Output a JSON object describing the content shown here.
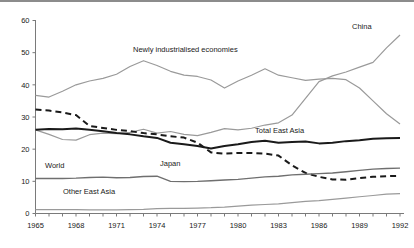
{
  "chart_data": {
    "type": "line",
    "title": "",
    "subtitle": "",
    "xlabel": "",
    "ylabel": "",
    "xlim": [
      1965,
      1992
    ],
    "ylim": [
      0,
      60
    ],
    "grid": false,
    "legend_position": "inline-annotations",
    "x": [
      1965,
      1966,
      1967,
      1968,
      1969,
      1970,
      1971,
      1972,
      1973,
      1974,
      1975,
      1976,
      1977,
      1978,
      1979,
      1980,
      1981,
      1982,
      1983,
      1984,
      1985,
      1986,
      1987,
      1988,
      1989,
      1990,
      1991,
      1992
    ],
    "xticks": [
      "1965",
      "1968",
      "1971",
      "1974",
      "1977",
      "1980",
      "1983",
      "1986",
      "1989",
      "1992"
    ],
    "yticks": [
      "0",
      "10",
      "20",
      "30",
      "40",
      "50",
      "60"
    ],
    "series": [
      {
        "name": "Newly industrialised economies",
        "color": "#9a9a9a",
        "style": "solid",
        "width": 1.2,
        "label_x": 133,
        "label_y": 52,
        "values": [
          36.7,
          36.2,
          38.0,
          40.0,
          41.2,
          42.0,
          43.3,
          45.7,
          47.5,
          46.0,
          44.2,
          43.0,
          42.6,
          41.5,
          39.0,
          41.2,
          43.0,
          45.0,
          43.0,
          42.2,
          41.4,
          41.8,
          42.0,
          41.6,
          39.0,
          35.0,
          31.0,
          27.8
        ]
      },
      {
        "name": "China",
        "color": "#9a9a9a",
        "style": "solid",
        "width": 1.2,
        "label_x": 352,
        "label_y": 29,
        "values": [
          26.0,
          24.6,
          23.0,
          22.8,
          24.5,
          25.0,
          24.8,
          25.2,
          26.2,
          25.0,
          25.5,
          24.6,
          24.2,
          25.2,
          26.4,
          26.0,
          26.5,
          27.5,
          28.2,
          30.6,
          35.8,
          41.0,
          42.8,
          44.0,
          45.5,
          47.0,
          51.5,
          55.5
        ]
      },
      {
        "name": "Total East Asia",
        "color": "#1a1a1a",
        "style": "solid",
        "width": 2.0,
        "label_x": 255,
        "label_y": 133,
        "values": [
          26.0,
          26.3,
          26.2,
          26.4,
          26.0,
          25.6,
          25.0,
          24.6,
          24.0,
          23.5,
          22.0,
          21.5,
          21.0,
          20.2,
          21.0,
          21.5,
          22.2,
          22.6,
          22.0,
          22.2,
          22.4,
          21.8,
          22.0,
          22.5,
          22.8,
          23.2,
          23.4,
          23.5
        ]
      },
      {
        "name": "Japan",
        "color": "#1a1a1a",
        "style": "dashed",
        "width": 2.0,
        "label_x": 160,
        "label_y": 166,
        "values": [
          32.3,
          32.0,
          31.4,
          30.6,
          27.2,
          26.6,
          26.0,
          25.6,
          25.0,
          24.6,
          24.0,
          23.6,
          22.0,
          19.0,
          18.6,
          18.8,
          18.8,
          18.6,
          18.0,
          15.0,
          12.6,
          11.4,
          10.6,
          10.5,
          11.0,
          11.4,
          11.6,
          11.7
        ]
      },
      {
        "name": "World",
        "color": "#6f6f6f",
        "style": "solid",
        "width": 1.4,
        "label_x": 45,
        "label_y": 168,
        "values": [
          10.9,
          10.9,
          10.9,
          11.0,
          11.2,
          11.3,
          11.1,
          11.2,
          11.5,
          11.6,
          10.0,
          9.9,
          10.0,
          10.2,
          10.4,
          10.6,
          11.0,
          11.4,
          11.6,
          12.0,
          12.2,
          12.4,
          12.6,
          13.0,
          13.4,
          13.8,
          14.0,
          14.1
        ]
      },
      {
        "name": "Other East Asia",
        "color": "#9a9a9a",
        "style": "solid",
        "width": 1.2,
        "label_x": 63,
        "label_y": 194,
        "values": [
          1.2,
          1.2,
          1.2,
          1.2,
          1.1,
          1.1,
          1.1,
          1.2,
          1.3,
          1.5,
          1.6,
          1.6,
          1.7,
          1.8,
          2.0,
          2.3,
          2.6,
          2.8,
          3.0,
          3.4,
          3.8,
          4.0,
          4.4,
          4.8,
          5.2,
          5.6,
          6.0,
          6.2
        ]
      }
    ]
  }
}
